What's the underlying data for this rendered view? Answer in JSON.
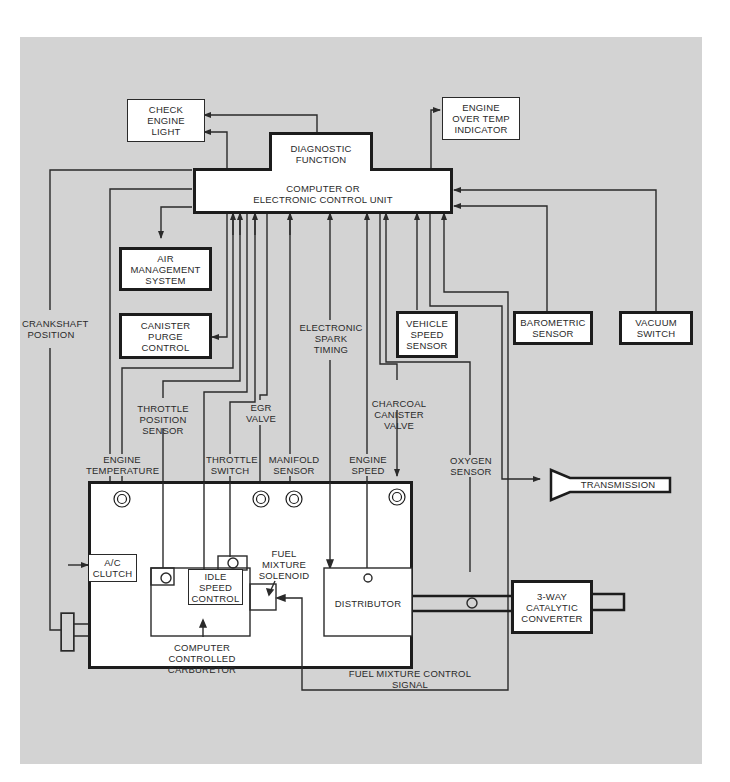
{
  "diagram": {
    "background_color": "#d3d3d3",
    "line_color": "#2a2a2a",
    "ecu": {
      "name": "COMPUTER OR\nELECTRONIC CONTROL UNIT",
      "diagnostic": "DIAGNOSTIC\nFUNCTION"
    },
    "outputs": {
      "check_engine_light": "CHECK\nENGINE\nLIGHT",
      "engine_over_temp": "ENGINE\nOVER TEMP\nINDICATOR",
      "air_management": "AIR\nMANAGEMENT\nSYSTEM",
      "canister_purge": "CANISTER\nPURGE\nCONTROL",
      "transmission": "TRANSMISSION"
    },
    "sensors": {
      "vehicle_speed": "VEHICLE\nSPEED\nSENSOR",
      "barometric": "BAROMETRIC\nSENSOR",
      "vacuum_switch": "VACUUM\nSWITCH"
    },
    "signal_labels": {
      "crankshaft_position": "CRANKSHAFT\nPOSITION",
      "electronic_spark_timing": "ELECTRONIC\nSPARK\nTIMING",
      "throttle_position_sensor": "THROTTLE\nPOSITION\nSENSOR",
      "egr_valve": "EGR\nVALVE",
      "charcoal_canister_valve": "CHARCOAL\nCANISTER\nVALVE",
      "oxygen_sensor": "OXYGEN\nSENSOR",
      "engine_temperature": "ENGINE\nTEMPERATURE",
      "throttle_switch": "THROTTLE\nSWITCH",
      "manifold_sensor": "MANIFOLD\nSENSOR",
      "engine_speed": "ENGINE\nSPEED",
      "fuel_mixture_control_signal": "FUEL MIXTURE CONTROL\nSIGNAL"
    },
    "engine": {
      "ac_clutch": "A/C\nCLUTCH",
      "idle_speed_control": "IDLE\nSPEED\nCONTROL",
      "fuel_mixture_solenoid": "FUEL\nMIXTURE\nSOLENOID",
      "carburetor": "COMPUTER CONTROLLED\nCARBURETOR",
      "distributor": "DISTRIBUTOR"
    },
    "exhaust": {
      "catalytic_converter": "3-WAY\nCATALYTIC\nCONVERTER"
    }
  }
}
